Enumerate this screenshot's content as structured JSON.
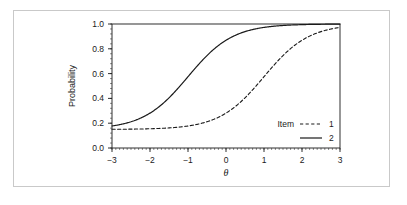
{
  "figure": {
    "background_color": "#ffffff",
    "border_color": "#c9c9c9",
    "axis_color": "#1a1a1a",
    "curve_color": "#1a1a1a"
  },
  "chart_data": {
    "type": "line",
    "title": "",
    "subtitle": "",
    "xlabel": "θ",
    "ylabel": "Probability",
    "xlim": [
      -3,
      3
    ],
    "ylim": [
      0.0,
      1.0
    ],
    "xticks": [
      -3,
      -2,
      -1,
      0,
      1,
      2,
      3
    ],
    "xtick_labels": [
      "−3",
      "−2",
      "−1",
      "0",
      "1",
      "2",
      "3"
    ],
    "yticks": [
      0.0,
      0.2,
      0.4,
      0.6,
      0.8,
      1.0
    ],
    "ytick_labels": [
      "0.0",
      "0.2",
      "0.4",
      "0.6",
      "0.8",
      "1.0"
    ],
    "grid": false,
    "minor_ticks": true,
    "legend": {
      "title": "Item",
      "position": "bottom-right-inside",
      "entries": [
        {
          "label": "1",
          "style": "dashed"
        },
        {
          "label": "2",
          "style": "solid"
        }
      ]
    },
    "series": [
      {
        "name": "1",
        "style": "dashed",
        "model": "3PL",
        "params": {
          "a": 1.7,
          "b": 1.0,
          "c": 0.15
        },
        "x": [
          -3.0,
          -2.75,
          -2.5,
          -2.25,
          -2.0,
          -1.75,
          -1.5,
          -1.25,
          -1.0,
          -0.75,
          -0.5,
          -0.25,
          0.0,
          0.25,
          0.5,
          0.75,
          1.0,
          1.25,
          1.5,
          1.75,
          2.0,
          2.25,
          2.5,
          2.75,
          3.0
        ],
        "y": [
          0.15,
          0.151,
          0.151,
          0.152,
          0.153,
          0.155,
          0.157,
          0.161,
          0.166,
          0.174,
          0.186,
          0.204,
          0.231,
          0.271,
          0.328,
          0.406,
          0.505,
          0.613,
          0.714,
          0.797,
          0.858,
          0.901,
          0.93,
          0.95,
          0.963
        ]
      },
      {
        "name": "2",
        "style": "solid",
        "model": "3PL",
        "params": {
          "a": 1.7,
          "b": -1.0,
          "c": 0.15
        },
        "x": [
          -3.0,
          -2.75,
          -2.5,
          -2.25,
          -2.0,
          -1.75,
          -1.5,
          -1.25,
          -1.0,
          -0.75,
          -0.5,
          -0.25,
          0.0,
          0.25,
          0.5,
          0.75,
          1.0,
          1.25,
          1.5,
          1.75,
          2.0,
          2.25,
          2.5,
          2.75,
          3.0
        ],
        "y": [
          0.186,
          0.204,
          0.231,
          0.271,
          0.328,
          0.406,
          0.505,
          0.613,
          0.714,
          0.797,
          0.858,
          0.901,
          0.93,
          0.95,
          0.963,
          0.973,
          0.98,
          0.985,
          0.989,
          0.992,
          0.994,
          0.996,
          0.997,
          0.998,
          0.998
        ]
      }
    ]
  }
}
